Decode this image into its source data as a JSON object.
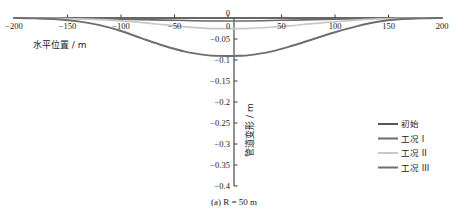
{
  "chart_data": {
    "type": "line",
    "title": "",
    "caption": "(a) R = 50 m",
    "caption_parts": {
      "index": "(a)",
      "symbol": "R",
      "equals": "=",
      "value": "50",
      "unit": "m"
    },
    "xlabel": "水平位置 / m",
    "ylabel": "管道变形 / m",
    "xlim": [
      -200,
      200
    ],
    "ylim": [
      -0.4,
      0
    ],
    "xticks": [
      -200,
      -150,
      -100,
      -50,
      0,
      50,
      100,
      150,
      200
    ],
    "xtick_labels": [
      "−200",
      "−150",
      "−100",
      "−50",
      "0",
      "50",
      "100",
      "150",
      "200"
    ],
    "yticks": [
      0,
      -0.05,
      -0.1,
      -0.15,
      -0.2,
      -0.25,
      -0.3,
      -0.35,
      -0.4
    ],
    "ytick_labels": [
      "0",
      "−0.05",
      "−0.1",
      "−0.15",
      "−0.2",
      "−0.25",
      "−0.3",
      "−0.35",
      "−0.4"
    ],
    "grid": false,
    "legend_position": "right",
    "x": [
      -200,
      -180,
      -160,
      -140,
      -120,
      -100,
      -80,
      -60,
      -40,
      -20,
      -10,
      0,
      10,
      20,
      40,
      60,
      80,
      100,
      120,
      140,
      160,
      180,
      200
    ],
    "series": [
      {
        "name": "初始",
        "color": "#555555",
        "width": 1.6,
        "values": [
          0,
          0,
          0,
          0,
          0,
          0,
          0,
          0,
          0,
          0,
          0,
          0,
          0,
          0,
          0,
          0,
          0,
          0,
          0,
          0,
          0,
          0,
          0
        ]
      },
      {
        "name": "工况 I",
        "color": "#6b6b6b",
        "width": 1.6,
        "values": [
          0,
          0,
          0,
          -0.001,
          -0.002,
          -0.003,
          -0.004,
          -0.005,
          -0.006,
          -0.007,
          -0.007,
          -0.007,
          -0.007,
          -0.007,
          -0.006,
          -0.005,
          -0.004,
          -0.003,
          -0.002,
          -0.001,
          0,
          0,
          0
        ]
      },
      {
        "name": "工况 II",
        "color": "#c8c8c8",
        "width": 1.7,
        "values": [
          0,
          0,
          -0.001,
          -0.002,
          -0.004,
          -0.007,
          -0.011,
          -0.016,
          -0.021,
          -0.0245,
          -0.0252,
          -0.0255,
          -0.0252,
          -0.0245,
          -0.022,
          -0.018,
          -0.013,
          -0.009,
          -0.005,
          -0.002,
          -0.001,
          0,
          0
        ]
      },
      {
        "name": "工况 III",
        "color": "#6e6e6e",
        "width": 1.9,
        "values": [
          0,
          -0.001,
          -0.003,
          -0.008,
          -0.017,
          -0.031,
          -0.049,
          -0.066,
          -0.08,
          -0.0885,
          -0.0902,
          -0.0905,
          -0.09,
          -0.0885,
          -0.08,
          -0.066,
          -0.05,
          -0.034,
          -0.02,
          -0.009,
          -0.003,
          -0.001,
          0
        ]
      }
    ],
    "legend": [
      {
        "label": "初始",
        "color": "#555555"
      },
      {
        "label": "工况 I",
        "color": "#6b6b6b"
      },
      {
        "label": "工况 II",
        "color": "#c8c8c8"
      },
      {
        "label": "工况 III",
        "color": "#6e6e6e"
      }
    ]
  }
}
